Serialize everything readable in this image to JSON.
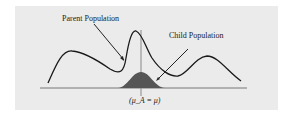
{
  "diagram": {
    "labels": {
      "parent": "Parent Population",
      "child": "Child Population",
      "mean": "(μ_A = μ)"
    },
    "colors": {
      "background": "#ebebeb",
      "curve": "#1a1a1a",
      "child_fill": "#555555",
      "axis": "#777777",
      "mean_line": "#888888"
    }
  }
}
